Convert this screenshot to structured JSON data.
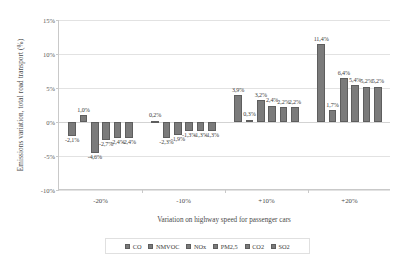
{
  "chart_data": {
    "type": "bar",
    "title": "",
    "xlabel": "Variation on highway speed for passenger cars",
    "ylabel": "Emissions variation, total road transport (%)",
    "ylim": [
      -10,
      15
    ],
    "yticks": [
      15,
      10,
      5,
      0,
      -5,
      -10
    ],
    "ytick_labels": [
      "15%",
      "10%",
      "5%",
      "0%",
      "-5%",
      "-10%"
    ],
    "grid": true,
    "legend_position": "bottom",
    "categories": [
      "-20%",
      "-10%",
      "+10%",
      "+20%"
    ],
    "series": [
      {
        "name": "CO",
        "values": [
          -2.1,
          0.2,
          3.9,
          11.4
        ],
        "labels": [
          "-2,1%",
          "0,2%",
          "3,9%",
          "11,4%"
        ]
      },
      {
        "name": "NMVOC",
        "values": [
          1.0,
          -2.3,
          0.3,
          1.7
        ],
        "labels": [
          "1,0%",
          "-2,3%",
          "0,3%",
          "1,7%"
        ]
      },
      {
        "name": "NOx",
        "values": [
          -4.6,
          -1.9,
          3.2,
          6.4
        ],
        "labels": [
          "-4,6%",
          "-1,9%",
          "3,2%",
          "6,4%"
        ]
      },
      {
        "name": "PM2,5",
        "values": [
          -2.7,
          -1.3,
          2.4,
          5.4
        ],
        "labels": [
          "-2,7%",
          "-1,3%",
          "2,4%",
          "5,4%"
        ]
      },
      {
        "name": "CO2",
        "values": [
          -2.4,
          -1.3,
          2.2,
          5.2
        ],
        "labels": [
          "-2,4%",
          "-1,3%",
          "2,2%",
          "5,2%"
        ]
      },
      {
        "name": "SO2",
        "values": [
          -2.4,
          -1.3,
          2.2,
          5.2
        ],
        "labels": [
          "-2,4%",
          "-1,3%",
          "2,2%",
          "5,2%"
        ]
      }
    ],
    "bar_color": "#7b7b7b"
  },
  "legend": {
    "items": [
      {
        "label": "CO"
      },
      {
        "label": "NMVOC"
      },
      {
        "label": "NOx"
      },
      {
        "label": "PM2,5"
      },
      {
        "label": "CO2"
      },
      {
        "label": "SO2"
      }
    ]
  }
}
